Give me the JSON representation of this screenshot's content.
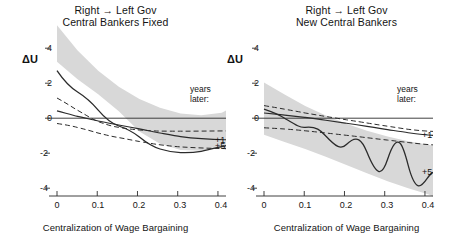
{
  "figure": {
    "y_axis_label": "ΔU",
    "x_axis_label": "Centralization of Wage Bargaining",
    "legend_header_line1": "years",
    "legend_header_line2": "later:",
    "series_label_1": "+1",
    "series_label_5": "+5",
    "band_color": "#d8d8d8",
    "line_color": "#2b2b2b",
    "text_color": "#141414"
  },
  "panels": [
    {
      "title_line1": "Right → Left Gov",
      "title_line2": "Central Bankers Fixed"
    },
    {
      "title_line1": "Right → Left Gov",
      "title_line2": "New Central Bankers"
    }
  ],
  "chart_data": [
    {
      "type": "line",
      "title": "Right → Left Gov — Central Bankers Fixed",
      "xlabel": "Centralization of Wage Bargaining",
      "ylabel": "ΔU",
      "xlim": [
        0,
        0.42
      ],
      "ylim": [
        -5,
        4.4
      ],
      "xticks": [
        0,
        0.1,
        0.2,
        0.3,
        0.4
      ],
      "xticklabels": [
        "0",
        "0.1",
        "0.2",
        "0.3",
        "0.4"
      ],
      "yticks": [
        4,
        2,
        0,
        -2,
        -4
      ],
      "yticklabels": [
        "4",
        "2",
        "0",
        "-2",
        "-4"
      ],
      "grid": false,
      "legend_position": "right",
      "annotations": [
        "years later:",
        "+1",
        "+5"
      ],
      "x": [
        0,
        0.05,
        0.1,
        0.15,
        0.2,
        0.25,
        0.3,
        0.35,
        0.4,
        0.42
      ],
      "series": [
        {
          "name": "+1",
          "style": "solid",
          "values": [
            0.42,
            0.22,
            0.04,
            -0.12,
            -0.27,
            -0.4,
            -0.5,
            -0.57,
            -0.6,
            -0.6
          ]
        },
        {
          "name": "+1 upper bound",
          "style": "dashed",
          "values": [
            1.15,
            0.82,
            0.55,
            0.33,
            0.18,
            0.08,
            0.03,
            0.0,
            0.0,
            0.0
          ]
        },
        {
          "name": "+1 lower bound",
          "style": "dashed",
          "values": [
            -0.3,
            -0.42,
            -0.55,
            -0.68,
            -0.82,
            -0.95,
            -1.05,
            -1.12,
            -1.16,
            -1.17
          ]
        },
        {
          "name": "+5",
          "style": "solid",
          "values": [
            2.72,
            1.5,
            0.45,
            -0.45,
            -1.2,
            -1.75,
            -2.05,
            -2.12,
            -1.95,
            -1.82
          ]
        },
        {
          "name": "+5 band upper",
          "style": "band",
          "values": [
            4.1,
            2.65,
            1.5,
            0.6,
            -0.1,
            -0.6,
            -0.92,
            -1.02,
            -0.88,
            -0.75
          ]
        },
        {
          "name": "+5 band lower",
          "style": "band",
          "values": [
            1.45,
            0.45,
            -0.4,
            -1.35,
            -2.2,
            -2.9,
            -3.25,
            -3.3,
            -3.1,
            -2.95
          ]
        },
        {
          "name": "zero reference",
          "style": "solid",
          "values": [
            0,
            0,
            0,
            0,
            0,
            0,
            0,
            0,
            0,
            0
          ]
        }
      ]
    },
    {
      "type": "line",
      "title": "Right → Left Gov — New Central Bankers",
      "xlabel": "Centralization of Wage Bargaining",
      "ylabel": "ΔU",
      "xlim": [
        0,
        0.42
      ],
      "ylim": [
        -5,
        4.4
      ],
      "xticks": [
        0,
        0.1,
        0.2,
        0.3,
        0.4
      ],
      "xticklabels": [
        "0",
        "0.1",
        "0.2",
        "0.3",
        "0.4"
      ],
      "yticks": [
        4,
        2,
        0,
        -2,
        -4
      ],
      "yticklabels": [
        "4",
        "2",
        "0",
        "-2",
        "-4"
      ],
      "grid": false,
      "legend_position": "right",
      "annotations": [
        "years later:",
        "+1",
        "+5"
      ],
      "x": [
        0,
        0.05,
        0.1,
        0.15,
        0.2,
        0.25,
        0.3,
        0.35,
        0.4,
        0.42
      ],
      "series": [
        {
          "name": "+1",
          "style": "solid",
          "values": [
            0.3,
            0.18,
            0.06,
            -0.06,
            -0.18,
            -0.3,
            -0.42,
            -0.53,
            -0.63,
            -0.67
          ]
        },
        {
          "name": "+1 upper bound",
          "style": "dashed",
          "values": [
            0.72,
            0.62,
            0.52,
            0.42,
            0.33,
            0.24,
            0.15,
            0.07,
            0.0,
            -0.03
          ]
        },
        {
          "name": "+1 lower bound",
          "style": "dashed",
          "values": [
            -0.55,
            -0.6,
            -0.66,
            -0.73,
            -0.8,
            -0.88,
            -0.96,
            -1.04,
            -1.12,
            -1.15
          ]
        },
        {
          "name": "+5",
          "style": "solid",
          "values": [
            0.52,
            0.0,
            -0.52,
            -1.02,
            -1.5,
            -1.95,
            -2.35,
            -2.7,
            -3.0,
            -3.1
          ]
        },
        {
          "name": "+5 band upper",
          "style": "band",
          "values": [
            2.05,
            1.35,
            0.7,
            0.15,
            -0.32,
            -0.72,
            -1.05,
            -1.32,
            -1.52,
            -1.58
          ]
        },
        {
          "name": "+5 band lower",
          "style": "band",
          "values": [
            -0.95,
            -1.35,
            -1.75,
            -2.2,
            -2.68,
            -3.15,
            -3.6,
            -4.0,
            -4.35,
            -4.48
          ]
        },
        {
          "name": "zero reference",
          "style": "solid",
          "values": [
            0,
            0,
            0,
            0,
            0,
            0,
            0,
            0,
            0,
            0
          ]
        }
      ]
    }
  ]
}
